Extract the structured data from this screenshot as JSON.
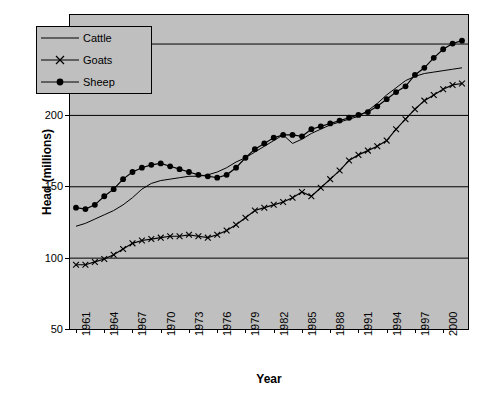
{
  "chart_data": {
    "type": "line",
    "title": "",
    "xlabel": "Year",
    "ylabel": "Head (millions)",
    "ylim": [
      50,
      270
    ],
    "yticks": [
      50,
      100,
      150,
      200,
      250
    ],
    "grid": true,
    "legend_position": "top-left-inside",
    "x": [
      1961,
      1962,
      1963,
      1964,
      1965,
      1966,
      1967,
      1968,
      1969,
      1970,
      1971,
      1972,
      1973,
      1974,
      1975,
      1976,
      1977,
      1978,
      1979,
      1980,
      1981,
      1982,
      1983,
      1984,
      1985,
      1986,
      1987,
      1988,
      1989,
      1990,
      1991,
      1992,
      1993,
      1994,
      1995,
      1996,
      1997,
      1998,
      1999,
      2000,
      2001,
      2002
    ],
    "xticks": [
      1961,
      1964,
      1967,
      1970,
      1973,
      1976,
      1979,
      1982,
      1985,
      1988,
      1991,
      1994,
      1997,
      2000
    ],
    "series": [
      {
        "name": "Cattle",
        "color": "#000000",
        "marker": "none",
        "values": [
          122,
          124,
          127,
          130,
          133,
          137,
          142,
          148,
          152,
          154,
          155,
          156,
          157,
          157,
          158,
          160,
          163,
          167,
          170,
          174,
          178,
          182,
          186,
          180,
          183,
          187,
          190,
          193,
          195,
          197,
          199,
          203,
          208,
          214,
          219,
          224,
          227,
          229,
          230,
          231,
          232,
          233
        ]
      },
      {
        "name": "Goats",
        "color": "#000000",
        "marker": "x",
        "values": [
          95,
          95,
          97,
          99,
          102,
          106,
          110,
          112,
          113,
          114,
          115,
          115,
          116,
          115,
          114,
          116,
          119,
          123,
          128,
          133,
          135,
          137,
          139,
          142,
          146,
          143,
          149,
          155,
          161,
          168,
          172,
          175,
          178,
          182,
          190,
          197,
          204,
          210,
          214,
          218,
          221,
          222
        ]
      },
      {
        "name": "Sheep",
        "color": "#000000",
        "marker": "filled-circle",
        "values": [
          135,
          134,
          137,
          143,
          148,
          155,
          160,
          163,
          165,
          166,
          164,
          162,
          160,
          158,
          157,
          156,
          158,
          163,
          170,
          176,
          180,
          184,
          186,
          186,
          185,
          190,
          192,
          194,
          196,
          198,
          200,
          202,
          206,
          211,
          216,
          220,
          228,
          233,
          240,
          246,
          250,
          252
        ]
      }
    ]
  },
  "legend": {
    "items": [
      {
        "label": "Cattle"
      },
      {
        "label": "Goats"
      },
      {
        "label": "Sheep"
      }
    ]
  },
  "axes": {
    "y_tick_labels": [
      "250",
      "200",
      "150",
      "100",
      "50"
    ],
    "x_tick_labels": [
      "1961",
      "1964",
      "1967",
      "1970",
      "1973",
      "1976",
      "1979",
      "1982",
      "1985",
      "1988",
      "1991",
      "1994",
      "1997",
      "2000"
    ],
    "x_axis_title": "Year",
    "y_axis_title": "Head (millions)"
  }
}
